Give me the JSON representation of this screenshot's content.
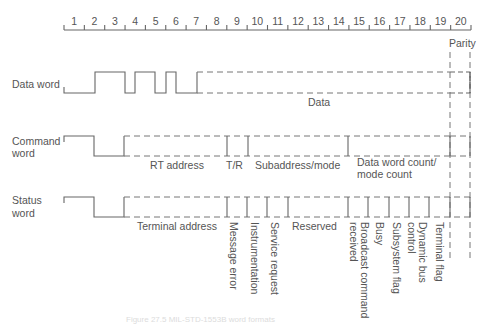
{
  "ruler": {
    "bits": [
      "1",
      "2",
      "3",
      "4",
      "5",
      "6",
      "7",
      "8",
      "9",
      "10",
      "11",
      "12",
      "13",
      "14",
      "15",
      "16",
      "17",
      "18",
      "19",
      "20"
    ]
  },
  "rows": {
    "data_word": {
      "label": "Data word",
      "fields": {
        "data": "Data",
        "parity": "Parity"
      }
    },
    "command_word": {
      "label_line1": "Command",
      "label_line2": "word",
      "fields": {
        "rt_address": "RT address",
        "tr": "T/R",
        "subaddress": "Subaddress/mode",
        "count_line1": "Data word count/",
        "count_line2": "mode count"
      }
    },
    "status_word": {
      "label_line1": "Status",
      "label_line2": "word",
      "fields": {
        "terminal_address": "Terminal address",
        "message_error": "Message error",
        "instrumentation": "Instrumentation",
        "service_request": "Service request",
        "reserved": "Reserved",
        "broadcast_line1": "Broadcast command",
        "broadcast_line2": "received",
        "busy": "Busy",
        "subsystem_flag": "Subsystem flag",
        "dynamic_line1": "Dynamic bus",
        "dynamic_line2": "control",
        "terminal_flag": "Terminal flag"
      }
    }
  },
  "caption": "Figure 27.5  MIL-STD-1553B word formats"
}
